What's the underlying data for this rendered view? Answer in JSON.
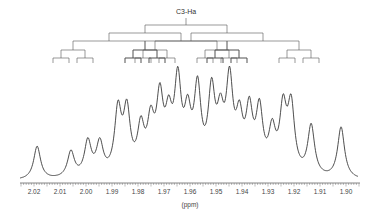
{
  "chart_data": {
    "type": "line",
    "title": "",
    "subtitle": "",
    "xlabel": "(ppm)",
    "ylabel": "",
    "xlim": [
      2.0235,
      1.8965
    ],
    "x_reversed": true,
    "grid": false,
    "legend": null,
    "annotations": [
      {
        "text": "C3-Ha",
        "kind": "coupling-tree-label"
      }
    ],
    "x_ticks": [
      "2.02",
      "2.01",
      "2.00",
      "1.99",
      "1.98",
      "1.97",
      "1.96",
      "1.95",
      "1.94",
      "1.93",
      "1.92",
      "1.91",
      "1.90"
    ],
    "x_tick_values": [
      2.02,
      2.01,
      2.0,
      1.99,
      1.98,
      1.97,
      1.96,
      1.95,
      1.94,
      1.93,
      1.92,
      1.91,
      1.9
    ],
    "series": [
      {
        "name": "1H NMR spectrum (C3-Ha multiplet)",
        "peaks_ppm": [
          2.0188,
          2.0058,
          1.9993,
          1.9947,
          1.9877,
          1.9843,
          1.9789,
          1.9751,
          1.9716,
          1.9682,
          1.9647,
          1.9609,
          1.9571,
          1.9517,
          1.9483,
          1.9448,
          1.941,
          1.9372,
          1.9333,
          1.9284,
          1.9242,
          1.9211,
          1.9134,
          1.9019
        ],
        "peak_heights_rel": [
          0.38,
          0.3,
          0.4,
          0.37,
          0.72,
          0.7,
          0.5,
          0.54,
          0.8,
          0.55,
          0.99,
          0.59,
          0.92,
          0.88,
          0.56,
          1.0,
          0.56,
          0.67,
          0.7,
          0.46,
          0.71,
          0.76,
          0.58,
          0.59
        ]
      }
    ],
    "coupling_tree": {
      "label": "C3-Ha",
      "levels": 5,
      "leaf_count": 32
    }
  },
  "figure": {
    "tree_label": "C3-Ha",
    "axis_title": "(ppm)",
    "tick_labels": [
      "2.02",
      "2.01",
      "2.00",
      "1.99",
      "1.98",
      "1.97",
      "1.96",
      "1.95",
      "1.94",
      "1.93",
      "1.92",
      "1.91",
      "1.90"
    ]
  },
  "colors": {
    "trace": "#3a3a3a",
    "tree": "#555555",
    "axis": "#555555",
    "background": "#ffffff"
  }
}
